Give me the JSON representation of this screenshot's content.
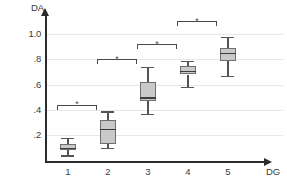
{
  "chart_data": {
    "type": "box",
    "title": "",
    "xlabel": "DG",
    "ylabel": "DA",
    "categories": [
      "1",
      "2",
      "3",
      "4",
      "5"
    ],
    "ylim": [
      0,
      1.1
    ],
    "yticks": [
      1.0,
      0.8,
      0.6,
      0.4,
      0.2
    ],
    "ytick_labels": [
      "1.0",
      ".8",
      ".6",
      ".4",
      ".2"
    ],
    "grid": true,
    "legend": "none",
    "boxes": [
      {
        "category": "1",
        "whisker_low": 0.04,
        "q1": 0.08,
        "median": 0.1,
        "q3": 0.13,
        "whisker_high": 0.18
      },
      {
        "category": "2",
        "whisker_low": 0.1,
        "q1": 0.13,
        "median": 0.25,
        "q3": 0.32,
        "whisker_high": 0.39
      },
      {
        "category": "3",
        "whisker_low": 0.37,
        "q1": 0.47,
        "median": 0.5,
        "q3": 0.62,
        "whisker_high": 0.74
      },
      {
        "category": "4",
        "whisker_low": 0.58,
        "q1": 0.68,
        "median": 0.71,
        "q3": 0.75,
        "whisker_high": 0.79
      },
      {
        "category": "5",
        "whisker_low": 0.67,
        "q1": 0.79,
        "median": 0.85,
        "q3": 0.89,
        "whisker_high": 0.98
      }
    ],
    "significance_brackets": [
      {
        "from": "1",
        "to": "2",
        "label": "*",
        "y": 0.44
      },
      {
        "from": "2",
        "to": "3",
        "label": "*",
        "y": 0.8
      },
      {
        "from": "3",
        "to": "4",
        "label": "*",
        "y": 0.92
      },
      {
        "from": "4",
        "to": "5",
        "label": "*",
        "y": 1.1
      }
    ],
    "colors": {
      "box_fill": "#c9c9c9",
      "box_border": "#6f6f6f",
      "median": "#3d3d3d",
      "whisker": "#555555",
      "axis": "#2b2b2b",
      "gridline": "#e8e8e8",
      "text": "#3a3a3a",
      "bracket": "#4a4a4a"
    }
  }
}
